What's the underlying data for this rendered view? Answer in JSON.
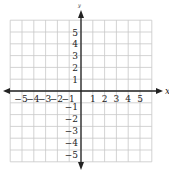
{
  "chart_data": {
    "type": "scatter",
    "title": "",
    "xlabel": "x",
    "ylabel": "y",
    "xlim": [
      -6,
      6
    ],
    "ylim": [
      -6,
      6
    ],
    "grid": true,
    "x_ticks": [
      "-5",
      "-4",
      "-3",
      "-2",
      "-1",
      "1",
      "2",
      "3",
      "4",
      "5"
    ],
    "y_ticks": [
      "5",
      "4",
      "3",
      "2",
      "1",
      "-1",
      "-2",
      "-3",
      "-4",
      "-5"
    ],
    "series": []
  },
  "axes": {
    "x_label": "x",
    "y_label": "y",
    "grid_color": "#c8c8c8",
    "axis_color": "#222222"
  }
}
